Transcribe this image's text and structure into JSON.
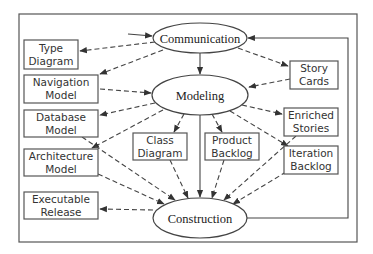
{
  "diagram": {
    "colors": {
      "stroke": "#444444",
      "box_border": "#555555",
      "text": "#333333",
      "background": "#ffffff"
    },
    "activities": {
      "communication": "Communication",
      "modeling": "Modeling",
      "construction": "Construction"
    },
    "artifacts": {
      "type_diagram": [
        "Type",
        "Diagram"
      ],
      "navigation_model": [
        "Navigation",
        "Model"
      ],
      "database_model": [
        "Database",
        "Model"
      ],
      "architecture_model": [
        "Architecture",
        "Model"
      ],
      "executable_release": [
        "Executable",
        "Release"
      ],
      "class_diagram": [
        "Class",
        "Diagram"
      ],
      "product_backlog": [
        "Product",
        "Backlog"
      ],
      "story_cards": [
        "Story",
        "Cards"
      ],
      "enriched_stories": [
        "Enriched",
        "Stories"
      ],
      "iteration_backlog": [
        "Iteration",
        "Backlog"
      ]
    },
    "edges": [
      {
        "from": "entry",
        "to": "Communication",
        "style": "solid"
      },
      {
        "from": "Communication",
        "to": "Modeling",
        "style": "solid"
      },
      {
        "from": "Modeling",
        "to": "Construction",
        "style": "solid"
      },
      {
        "from": "Construction",
        "to": "Communication",
        "style": "solid"
      },
      {
        "from": "Communication",
        "to": "Type Diagram",
        "style": "dashed"
      },
      {
        "from": "Communication",
        "to": "Navigation Model",
        "style": "dashed"
      },
      {
        "from": "Communication",
        "to": "Story Cards",
        "style": "dashed"
      },
      {
        "from": "Navigation Model",
        "to": "Modeling",
        "style": "dashed"
      },
      {
        "from": "Story Cards",
        "to": "Modeling",
        "style": "dashed"
      },
      {
        "from": "Modeling",
        "to": "Database Model",
        "style": "dashed"
      },
      {
        "from": "Modeling",
        "to": "Architecture Model",
        "style": "dashed"
      },
      {
        "from": "Modeling",
        "to": "Class Diagram",
        "style": "dashed"
      },
      {
        "from": "Modeling",
        "to": "Product Backlog",
        "style": "dashed"
      },
      {
        "from": "Modeling",
        "to": "Enriched Stories",
        "style": "dashed"
      },
      {
        "from": "Modeling",
        "to": "Iteration Backlog",
        "style": "dashed"
      },
      {
        "from": "Database Model",
        "to": "Construction",
        "style": "dashed"
      },
      {
        "from": "Architecture Model",
        "to": "Construction",
        "style": "dashed"
      },
      {
        "from": "Class Diagram",
        "to": "Construction",
        "style": "dashed"
      },
      {
        "from": "Product Backlog",
        "to": "Construction",
        "style": "dashed"
      },
      {
        "from": "Enriched Stories",
        "to": "Construction",
        "style": "dashed"
      },
      {
        "from": "Iteration Backlog",
        "to": "Construction",
        "style": "dashed"
      },
      {
        "from": "Construction",
        "to": "Executable Release",
        "style": "dashed"
      }
    ]
  }
}
